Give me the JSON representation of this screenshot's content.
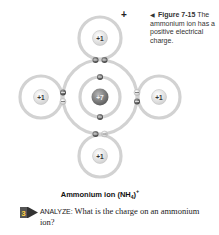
{
  "figure": {
    "number_label": "Figure 7-15",
    "arrow_icon": "left-pointer-icon",
    "caption": "The ammonium ion has a positive electrical charge.",
    "ion_charge_symbol": "+"
  },
  "diagram": {
    "central_atom": {
      "element": "N",
      "nucleus_label": "+7"
    },
    "hydrogen_atoms": [
      {
        "position": "top",
        "nucleus_label": "+1"
      },
      {
        "position": "left",
        "nucleus_label": "+1"
      },
      {
        "position": "right",
        "nucleus_label": "+1"
      },
      {
        "position": "bottom",
        "nucleus_label": "+1"
      }
    ],
    "electron_marker": "−",
    "colors": {
      "ring": "#cfcfcf",
      "electron_dark": "#555555",
      "nucleus_center": "#7a7a7a",
      "h_nucleus": "#e6e6e6"
    }
  },
  "ion_label": {
    "name": "Ammonium ion (NH",
    "subscript": "4",
    "close": ")",
    "superscript": "+"
  },
  "question": {
    "step_number": "3",
    "keyword": "ANALYZE:",
    "text": " What is the charge on an ammonium ion?"
  }
}
